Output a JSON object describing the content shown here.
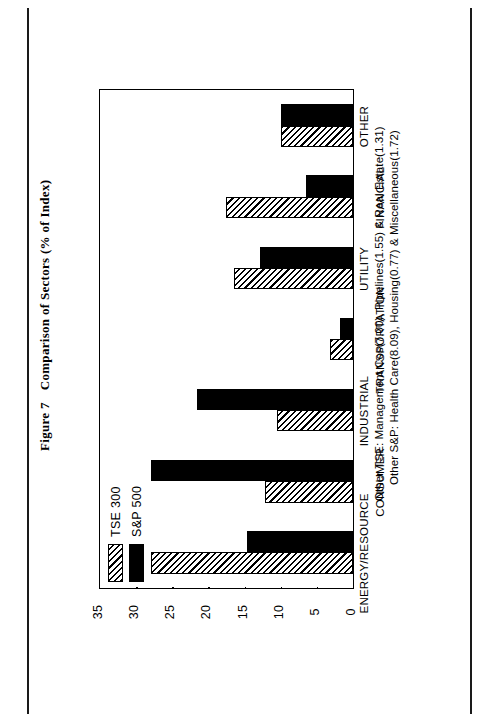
{
  "caption": {
    "figure_number": "Figure 7",
    "title": "Comparison of Sectors (% of Index)"
  },
  "legend": {
    "position": "top-left-inside-plot",
    "entries": [
      {
        "label": "TSE 300",
        "pattern": "diagonal-hatch"
      },
      {
        "label": "S&P 500",
        "pattern": "solid-black"
      }
    ]
  },
  "footnotes": [
    "Other TSE: Management Cos(7.00), Pipelines(1.55) & Real Estate(1.31)",
    "Other S&P: Health Care(8.09), Housing(0.77) & Miscellaneous(1.72)"
  ],
  "chart_data": {
    "type": "bar",
    "title": "Comparison of Sectors (% of Index)",
    "orientation": "vertical",
    "xlabel": "",
    "ylabel": "% of Index",
    "ylim": [
      0,
      35
    ],
    "yticks": [
      0,
      5,
      10,
      15,
      20,
      25,
      30,
      35
    ],
    "ytick_labels": [
      "0",
      "5",
      "10",
      "15",
      "20",
      "25",
      "30",
      "35"
    ],
    "grid": true,
    "legend_position": "upper left",
    "categories": [
      "ENERGY/RESOURCE",
      "CONSUMER",
      "INDUSTRIAL",
      "TRANSPORTATION",
      "UTILITY",
      "FINANCIAL",
      "OTHER"
    ],
    "series": [
      {
        "name": "TSE 300",
        "values": [
          28.0,
          12.2,
          10.5,
          3.2,
          16.4,
          17.6,
          9.9
        ]
      },
      {
        "name": "S&P 500",
        "values": [
          14.6,
          28.0,
          21.6,
          1.8,
          12.8,
          6.5,
          9.9
        ]
      }
    ]
  }
}
